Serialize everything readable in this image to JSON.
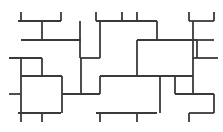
{
  "figure": {
    "name": "pinwheel-tiling-pattern",
    "type": "geometric-tiling-diagram",
    "width": 223,
    "height": 132,
    "background_color": "#ffffff",
    "stroke_color": "#3a3a3a",
    "stroke_width": 1.8,
    "stroke_linecap": "butt"
  },
  "chart_data": {
    "type": "diagram",
    "title": "",
    "xlabel": "",
    "ylabel": "",
    "xlim": [
      0,
      223
    ],
    "ylim": [
      0,
      132
    ],
    "grid": false,
    "legend": "none",
    "segments": [
      {
        "id": "h-top-1",
        "orientation": "horizontal",
        "x1": 18,
        "x2": 61,
        "y": 21
      },
      {
        "id": "h-top-2",
        "orientation": "horizontal",
        "x1": 96,
        "x2": 157,
        "y": 21
      },
      {
        "id": "h-top-3",
        "orientation": "horizontal",
        "x1": 189,
        "x2": 214,
        "y": 21
      },
      {
        "id": "h-r1-a",
        "orientation": "horizontal",
        "x1": 21,
        "x2": 81,
        "y": 40
      },
      {
        "id": "h-r1-b",
        "orientation": "horizontal",
        "x1": 137,
        "x2": 197,
        "y": 40
      },
      {
        "id": "h-r1-c",
        "orientation": "horizontal",
        "x1": 197,
        "x2": 214,
        "y": 40
      },
      {
        "id": "h-r2-a",
        "orientation": "horizontal",
        "x1": 9,
        "x2": 42,
        "y": 58
      },
      {
        "id": "h-r2-b",
        "orientation": "horizontal",
        "x1": 80,
        "x2": 100,
        "y": 58
      },
      {
        "id": "h-r2-c",
        "orientation": "horizontal",
        "x1": 193,
        "x2": 218,
        "y": 58
      },
      {
        "id": "h-r3-a",
        "orientation": "horizontal",
        "x1": 21,
        "x2": 62,
        "y": 76
      },
      {
        "id": "h-r3-b",
        "orientation": "horizontal",
        "x1": 100,
        "x2": 160,
        "y": 76
      },
      {
        "id": "h-r3-c",
        "orientation": "horizontal",
        "x1": 160,
        "x2": 193,
        "y": 76
      },
      {
        "id": "h-r4-a",
        "orientation": "horizontal",
        "x1": 62,
        "x2": 100,
        "y": 94
      },
      {
        "id": "h-r4-b",
        "orientation": "horizontal",
        "x1": 175,
        "x2": 214,
        "y": 94
      },
      {
        "id": "h-r4-c",
        "orientation": "horizontal",
        "x1": 9,
        "x2": 21,
        "y": 94
      },
      {
        "id": "h-bot-1",
        "orientation": "horizontal",
        "x1": 18,
        "x2": 61,
        "y": 113
      },
      {
        "id": "h-bot-2",
        "orientation": "horizontal",
        "x1": 96,
        "x2": 157,
        "y": 113
      },
      {
        "id": "h-bot-3",
        "orientation": "horizontal",
        "x1": 189,
        "x2": 214,
        "y": 113
      },
      {
        "id": "v-left-edge",
        "orientation": "vertical",
        "y1": 58,
        "y2": 113,
        "x": 21
      },
      {
        "id": "v-stub-tl",
        "orientation": "vertical",
        "y1": 12,
        "y2": 21,
        "x": 21
      },
      {
        "id": "v-stub-bl",
        "orientation": "vertical",
        "y1": 113,
        "y2": 122,
        "x": 21
      },
      {
        "id": "v-c1-top",
        "orientation": "vertical",
        "y1": 21,
        "y2": 40,
        "x": 42
      },
      {
        "id": "v-c1-mid",
        "orientation": "vertical",
        "y1": 58,
        "y2": 76,
        "x": 42
      },
      {
        "id": "v-stub-b1",
        "orientation": "vertical",
        "y1": 113,
        "y2": 122,
        "x": 42
      },
      {
        "id": "v-c2-top",
        "orientation": "vertical",
        "y1": 12,
        "y2": 21,
        "x": 61
      },
      {
        "id": "v-c2-mid",
        "orientation": "vertical",
        "y1": 76,
        "y2": 94,
        "x": 62
      },
      {
        "id": "v-c2-bot",
        "orientation": "vertical",
        "y1": 94,
        "y2": 113,
        "x": 62
      },
      {
        "id": "v-c3",
        "orientation": "vertical",
        "y1": 21,
        "y2": 58,
        "x": 80
      },
      {
        "id": "v-c3-low",
        "orientation": "vertical",
        "y1": 58,
        "y2": 94,
        "x": 81
      },
      {
        "id": "v-c4-top",
        "orientation": "vertical",
        "y1": 12,
        "y2": 21,
        "x": 96
      },
      {
        "id": "v-c4",
        "orientation": "vertical",
        "y1": 21,
        "y2": 58,
        "x": 100
      },
      {
        "id": "v-c4-low",
        "orientation": "vertical",
        "y1": 76,
        "y2": 94,
        "x": 100
      },
      {
        "id": "v-stub-b4",
        "orientation": "vertical",
        "y1": 113,
        "y2": 122,
        "x": 100
      },
      {
        "id": "v-c5-top",
        "orientation": "vertical",
        "y1": 12,
        "y2": 21,
        "x": 122
      },
      {
        "id": "v-c5",
        "orientation": "vertical",
        "y1": 40,
        "y2": 76,
        "x": 137
      },
      {
        "id": "v-c5-stub",
        "orientation": "vertical",
        "y1": 12,
        "y2": 21,
        "x": 137
      },
      {
        "id": "v-stub-b5",
        "orientation": "vertical",
        "y1": 113,
        "y2": 122,
        "x": 137
      },
      {
        "id": "v-c6",
        "orientation": "vertical",
        "y1": 21,
        "y2": 40,
        "x": 157
      },
      {
        "id": "v-c6-low",
        "orientation": "vertical",
        "y1": 76,
        "y2": 113,
        "x": 160
      },
      {
        "id": "v-c7-top",
        "orientation": "vertical",
        "y1": 12,
        "y2": 21,
        "x": 189
      },
      {
        "id": "v-c7",
        "orientation": "vertical",
        "y1": 21,
        "y2": 58,
        "x": 193
      },
      {
        "id": "v-c7-low",
        "orientation": "vertical",
        "y1": 58,
        "y2": 94,
        "x": 193
      },
      {
        "id": "v-c8-stub",
        "orientation": "vertical",
        "y1": 12,
        "y2": 21,
        "x": 214
      },
      {
        "id": "v-c8",
        "orientation": "vertical",
        "y1": 40,
        "y2": 58,
        "x": 197
      },
      {
        "id": "v-c8-low",
        "orientation": "vertical",
        "y1": 94,
        "y2": 113,
        "x": 214
      },
      {
        "id": "v-stub-br",
        "orientation": "vertical",
        "y1": 113,
        "y2": 122,
        "x": 189
      },
      {
        "id": "v-stub-r2",
        "orientation": "vertical",
        "y1": 76,
        "y2": 94,
        "x": 175
      }
    ]
  }
}
